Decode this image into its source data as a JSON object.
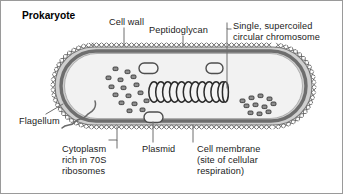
{
  "title": "Prokaryote",
  "diagram": {
    "type": "biological-cell-diagram",
    "shape": "stadium / rod-shaped (bacillus) with rounded caps"
  },
  "labels": {
    "cell_wall": "Cell wall",
    "peptidoglycan": "Peptidoglycan",
    "chromosome": "Single, supercoiled\ncircular chromosome",
    "flagellum": "Flagellum",
    "cytoplasm": "Cytoplasm\nrich in 70S\nribosomes",
    "plasmid": "Plasmid",
    "cell_membrane": "Cell membrane\n(site of cellular\nrespiration)"
  },
  "structures": {
    "cell_wall_hatch_marks": 74,
    "chromosome_coils": 11,
    "plasmids": 3,
    "ribosomes_left_cluster": 16,
    "ribosomes_right_cluster": 11,
    "flagella": 1
  },
  "colors": {
    "background": "#ffffff",
    "frame_border": "#9a9a9a",
    "text": "#1b1b1b",
    "title_text": "#000000",
    "leader_line": "#6f6f6f",
    "cell_wall_outline": "#7a7a7a",
    "cell_membrane_band": "#6e6e6e",
    "cytoplasm_fill": "#f2f2f2",
    "periplasm_fill": "#cfcfcf",
    "ribosome_fill": "#8d8d8d",
    "ribosome_stroke": "#3a3a3a",
    "chromosome_stroke": "#2b2b2b",
    "plasmid_stroke": "#555555",
    "flagellum_stroke": "#6a6a6a"
  }
}
